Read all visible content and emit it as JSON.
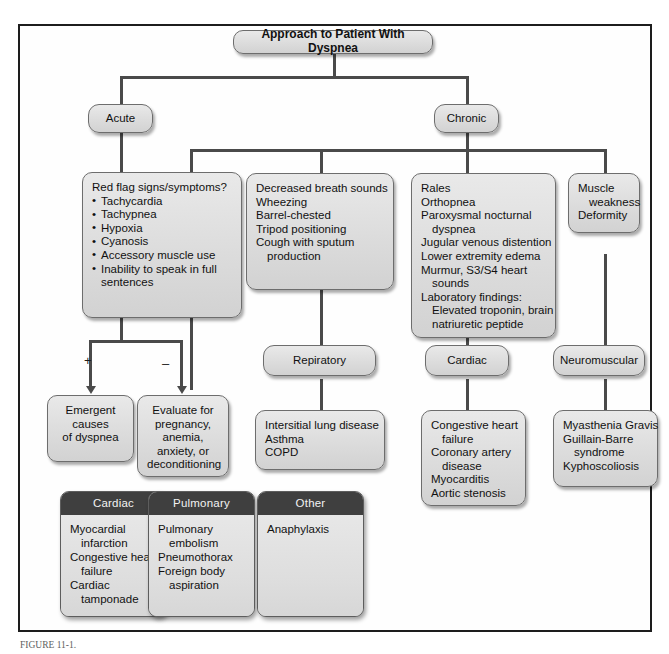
{
  "diagram": {
    "title_node": {
      "label": "Approach to Patient With Dyspnea"
    },
    "branch_acute": {
      "label": "Acute"
    },
    "branch_chronic": {
      "label": "Chronic"
    },
    "red_flags": {
      "heading": "Red flag signs/symptoms?",
      "items": [
        "Tachycardia",
        "Tachypnea",
        "Hypoxia",
        "Cyanosis",
        "Accessory muscle use",
        "Inability to speak in full",
        "sentences"
      ]
    },
    "sign_positive": "+",
    "sign_negative": "–",
    "emergent_box": {
      "lines": [
        "Emergent",
        "causes",
        "of dyspnea"
      ]
    },
    "evaluate_box": {
      "lines": [
        "Evaluate for",
        "pregnancy,",
        "anemia,",
        "anxiety, or",
        "deconditioning"
      ]
    },
    "pulmonary_findings": {
      "lines": [
        "Decreased breath sounds",
        "Wheezing",
        "Barrel-chested",
        "Tripod positioning",
        "Cough with sputum",
        "production"
      ],
      "indent": [
        false,
        false,
        false,
        false,
        false,
        true
      ]
    },
    "cardiac_findings": {
      "lines": [
        "Rales",
        "Orthopnea",
        "Paroxysmal nocturnal",
        "dyspnea",
        "Jugular venous distention",
        "Lower extremity edema",
        "Murmur, S3/S4 heart",
        "sounds",
        "Laboratory findings:",
        "Elevated troponin, brain",
        "natriuretic peptide"
      ],
      "indent": [
        false,
        false,
        false,
        true,
        false,
        false,
        false,
        true,
        false,
        true,
        true
      ]
    },
    "neuro_findings": {
      "lines": [
        "Muscle",
        "weakness",
        "Deformity"
      ],
      "indent": [
        false,
        true,
        false
      ]
    },
    "cat_respiratory": {
      "label": "Repiratory"
    },
    "cat_cardiac": {
      "label": "Cardiac"
    },
    "cat_neuromuscular": {
      "label": "Neuromuscular"
    },
    "dx_respiratory": {
      "lines": [
        "Intersitial lung disease",
        "Asthma",
        "COPD"
      ],
      "indent": [
        false,
        false,
        false
      ]
    },
    "dx_cardiac": {
      "lines": [
        "Congestive heart",
        "failure",
        "Coronary artery",
        "disease",
        "Myocarditis",
        "Aortic stenosis"
      ],
      "indent": [
        false,
        true,
        false,
        true,
        false,
        false
      ]
    },
    "dx_neuromuscular": {
      "lines": [
        "Myasthenia Gravis",
        "Guillain-Barre",
        "syndrome",
        "Kyphoscoliosis"
      ],
      "indent": [
        false,
        false,
        true,
        false
      ]
    },
    "emergent_cards": [
      {
        "header": "Cardiac",
        "lines": [
          "Myocardial",
          "infarction",
          "Congestive heart",
          "failure",
          "Cardiac",
          "tamponade"
        ],
        "indent": [
          false,
          true,
          false,
          true,
          false,
          true
        ]
      },
      {
        "header": "Pulmonary",
        "lines": [
          "Pulmonary",
          "embolism",
          "Pneumothorax",
          "Foreign body",
          "aspiration"
        ],
        "indent": [
          false,
          true,
          false,
          false,
          true
        ]
      },
      {
        "header": "Other",
        "lines": [
          "Anaphylaxis"
        ],
        "indent": [
          false
        ]
      }
    ],
    "caption": "FIGURE 11-1.",
    "colors": {
      "line": "#4a4a4a",
      "node_fill": "#dcdcdc",
      "node_border": "#6d6d6d",
      "card_header_bg": "#3f3f3f",
      "frame_border": "#1d1d1d"
    }
  }
}
